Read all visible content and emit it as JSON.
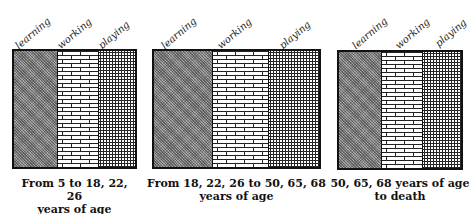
{
  "legend": {
    "learning": "learning",
    "working": "working",
    "playing": "playing"
  },
  "panels": [
    {
      "caption_line1": "From 5 to 18, 22, 26",
      "caption_line2": "years of age",
      "labels": [
        "learning",
        "working",
        "playing"
      ]
    },
    {
      "caption_line1": "From 18, 22, 26 to 50, 65, 68",
      "caption_line2": "years of age",
      "labels": [
        "learning",
        "working",
        "playing"
      ]
    },
    {
      "caption_line1": "50, 65, 68 years of age",
      "caption_line2": "to death",
      "labels": [
        "learning",
        "working",
        "playing"
      ]
    }
  ],
  "patterns": {
    "learning": "dense-gray-crosshatch",
    "working": "brick",
    "playing": "small-circles"
  }
}
